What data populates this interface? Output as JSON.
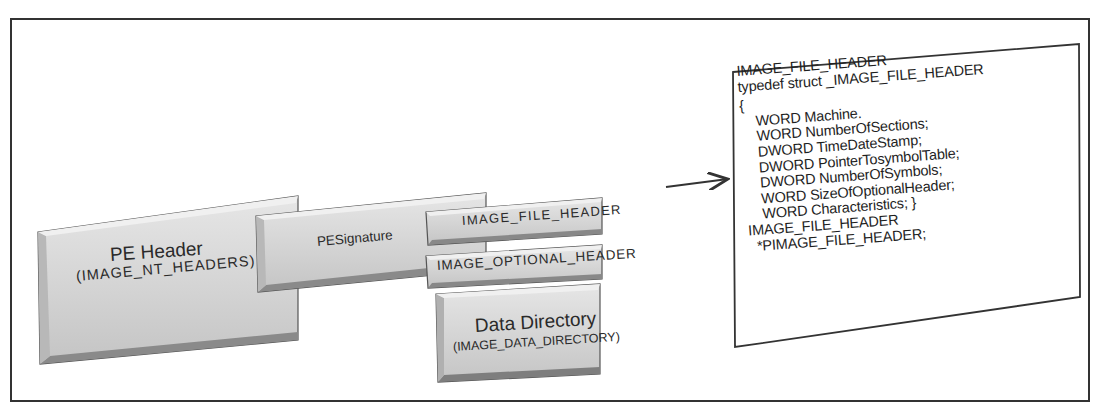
{
  "diagram": {
    "pe_header": {
      "title": "PE Header",
      "subtitle": "(IMAGE_NT_HEADERS)"
    },
    "pe_signature": {
      "title": "PESignature"
    },
    "image_file_header": {
      "title": "IMAGE_FILE_HEADER"
    },
    "image_optional_header": {
      "title": "IMAGE_OPTIONAL_HEADER"
    },
    "data_directory": {
      "title": "Data Directory",
      "subtitle": "(IMAGE_DATA_DIRECTORY)"
    },
    "code_panel": {
      "lines": [
        "IMAGE_FILE_HEADER",
        "typedef struct _IMAGE_FILE_HEADER",
        "{",
        "    WORD Machine.",
        "    WORD NumberOfSections;",
        "    DWORD TimeDateStamp;",
        "    DWORD PointerTosymbolTable;",
        "    DWORD NumberOfSymbols;",
        "    WORD SizeOfOptionalHeader;",
        "    WORD Characteristics; }",
        "IMAGE_FILE_HEADER",
        "  *PIMAGE_FILE_HEADER;"
      ]
    },
    "colors": {
      "box_fill": "#d6d6d6",
      "box_edge_dark": "#7a7a7a",
      "box_edge_light": "#f2f2f2",
      "outline": "#333333"
    }
  }
}
